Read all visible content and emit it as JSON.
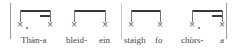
{
  "notation": {
    "notehead_glyph": "×",
    "barlines": [
      10,
      121,
      153,
      226
    ],
    "groups": [
      {
        "id": "group-1",
        "left": 20,
        "width": 30,
        "secondary_beam": true,
        "first_dotted": true,
        "syllables": [
          "Thàn-a"
        ]
      },
      {
        "id": "group-2",
        "left": 74,
        "width": 31,
        "secondary_beam": false,
        "first_dotted": false,
        "syllables": [
          "bleid-",
          "ein"
        ]
      },
      {
        "id": "group-3",
        "left": 131,
        "width": 29,
        "secondary_beam": false,
        "first_dotted": false,
        "syllables": [
          "staigh",
          "fo"
        ]
      },
      {
        "id": "group-4",
        "left": 192,
        "width": 30,
        "secondary_beam": true,
        "first_dotted": true,
        "syllables": [
          "chòrs-",
          "a"
        ]
      }
    ]
  },
  "lyrics": {
    "g1": "Thàn-a",
    "g2a": "bleid-",
    "g2b": "ein",
    "g3a": "staigh",
    "g3b": "fo",
    "g4a": "chòrs-",
    "g4b": "a"
  },
  "glyphs": {
    "notehead": "×"
  }
}
